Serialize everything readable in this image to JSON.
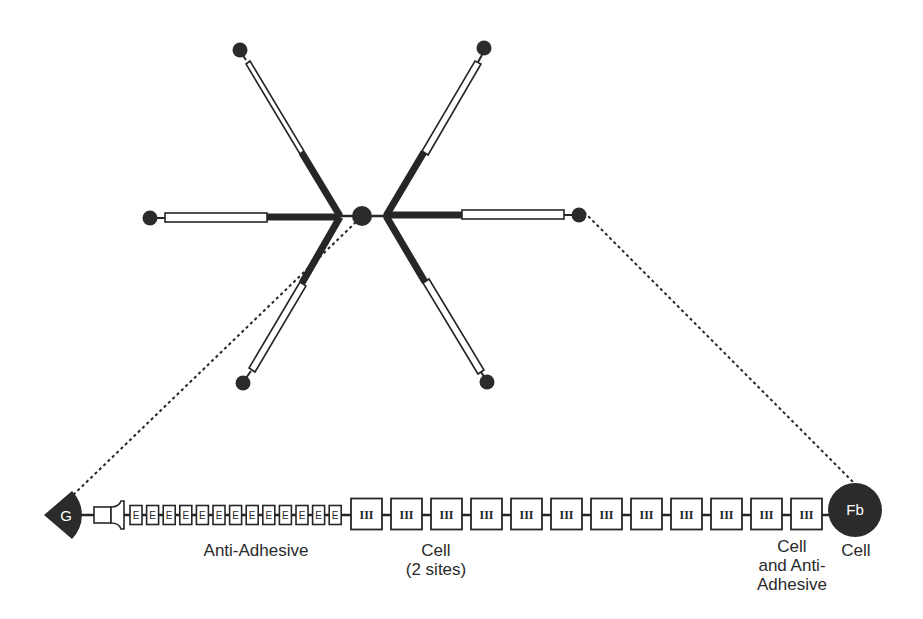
{
  "figure": {
    "type": "molecular-structure-diagram",
    "colors": {
      "ink": "#262626",
      "fill_dark": "#2b2b2b",
      "background": "#ffffff",
      "domain_fill": "#ffffff",
      "label_text": "#2a2a2a",
      "knob_text": "#ffffff"
    }
  },
  "hexabrachion": {
    "center": {
      "x": 362,
      "y": 216,
      "r": 10
    },
    "arms": [
      {
        "name": "arm-upper-left",
        "knob": {
          "x": 240,
          "y": 50
        }
      },
      {
        "name": "arm-left",
        "knob": {
          "x": 150,
          "y": 218
        }
      },
      {
        "name": "arm-lower-left",
        "knob": {
          "x": 243,
          "y": 383
        }
      },
      {
        "name": "arm-upper-right",
        "knob": {
          "x": 484,
          "y": 48
        }
      },
      {
        "name": "arm-right",
        "knob": {
          "x": 579,
          "y": 215
        }
      },
      {
        "name": "arm-lower-right",
        "knob": {
          "x": 487,
          "y": 382
        }
      }
    ]
  },
  "domain_chain": {
    "y": 515,
    "g_domain": {
      "label": "G"
    },
    "fb_domain": {
      "label": "Fb"
    },
    "egf_repeat_label": "E",
    "egf_repeat_count": 13,
    "fn3_repeat_label": "III",
    "fn3_repeat_count": 12
  },
  "labels": {
    "anti_adhesive": "Anti-Adhesive",
    "cell_line1": "Cell",
    "cell_line2": "(2 sites)",
    "cell_anti_line1": "Cell",
    "cell_anti_line2": "and Anti-",
    "cell_anti_line3": "Adhesive",
    "fb_cell": "Cell"
  }
}
